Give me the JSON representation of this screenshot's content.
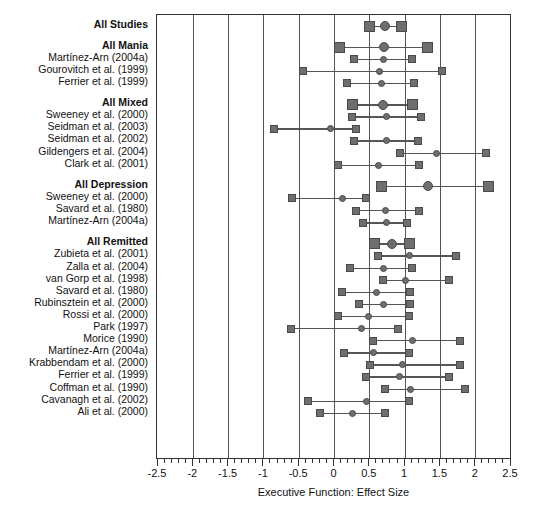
{
  "chart_data": {
    "type": "forest",
    "title": "",
    "xlabel": "Executive Function: Effect Size",
    "ylabel": "",
    "xlim": [
      -2.5,
      2.5
    ],
    "xticks": [
      -2.5,
      -2,
      -1.5,
      -1,
      -0.5,
      0,
      0.5,
      1,
      1.5,
      2,
      2.5
    ],
    "xtick_labels": [
      "-2.5",
      "-2",
      "-1.5",
      "-1",
      "-0.5",
      "0",
      "0.5",
      "1",
      "1.5",
      "2",
      "2.5"
    ],
    "minor_tick_step": 0.1,
    "grid": "vertical gridlines at every major tick",
    "legend": "none",
    "marker_point": "circle",
    "marker_ci_end": "square",
    "rows": [
      {
        "label": "All Studies",
        "group": true,
        "summary": true,
        "estimate": 0.72,
        "ci_low": 0.5,
        "ci_high": 0.95
      },
      {
        "label": "",
        "spacer": true
      },
      {
        "label": "All Mania",
        "group": true,
        "summary": true,
        "estimate": 0.7,
        "ci_low": 0.07,
        "ci_high": 1.32
      },
      {
        "label": "Martínez-Arn (2004a)",
        "group": false,
        "estimate": 0.69,
        "ci_low": 0.28,
        "ci_high": 1.1
      },
      {
        "label": "Gourovitch et al. (1999)",
        "group": false,
        "estimate": 0.64,
        "ci_low": -0.45,
        "ci_high": 1.52
      },
      {
        "label": "Ferrier et al. (1999)",
        "group": false,
        "estimate": 0.66,
        "ci_low": 0.17,
        "ci_high": 1.13
      },
      {
        "label": "",
        "spacer": true
      },
      {
        "label": "All Mixed",
        "group": true,
        "summary": true,
        "estimate": 0.68,
        "ci_low": 0.25,
        "ci_high": 1.11
      },
      {
        "label": "Sweeney et al. (2000)",
        "group": false,
        "estimate": 0.73,
        "ci_low": 0.25,
        "ci_high": 1.22
      },
      {
        "label": "Seidman et al. (2003)",
        "group": false,
        "estimate": -0.05,
        "ci_low": -0.85,
        "ci_high": 0.3
      },
      {
        "label": "Seidman et al. (2002)",
        "group": false,
        "estimate": 0.73,
        "ci_low": 0.28,
        "ci_high": 1.18
      },
      {
        "label": "Gildengers et al. (2004)",
        "group": false,
        "estimate": 1.45,
        "ci_low": 0.93,
        "ci_high": 2.15
      },
      {
        "label": "Clark et al. (2001)",
        "group": false,
        "estimate": 0.63,
        "ci_low": 0.05,
        "ci_high": 1.2
      },
      {
        "label": "",
        "spacer": true
      },
      {
        "label": "All Depression",
        "group": true,
        "summary": true,
        "estimate": 1.32,
        "ci_low": 0.66,
        "ci_high": 2.18
      },
      {
        "label": "Sweeney et al. (2000)",
        "group": false,
        "estimate": 0.12,
        "ci_low": -0.6,
        "ci_high": 0.45
      },
      {
        "label": "Savard et al. (1980)",
        "group": false,
        "estimate": 0.72,
        "ci_low": 0.3,
        "ci_high": 1.2
      },
      {
        "label": "Martínez-Arn (2004a)",
        "group": false,
        "estimate": 0.74,
        "ci_low": 0.4,
        "ci_high": 1.03
      },
      {
        "label": "",
        "spacer": true
      },
      {
        "label": "All Remitted",
        "group": true,
        "summary": true,
        "estimate": 0.82,
        "ci_low": 0.56,
        "ci_high": 1.06
      },
      {
        "label": "Zubieta et al. (2001)",
        "group": false,
        "estimate": 1.06,
        "ci_low": 0.62,
        "ci_high": 1.72
      },
      {
        "label": "Zalla et al. (2004)",
        "group": false,
        "estimate": 0.7,
        "ci_low": 0.22,
        "ci_high": 1.1
      },
      {
        "label": "van Gorp et al. (1998)",
        "group": false,
        "estimate": 1.0,
        "ci_low": 0.68,
        "ci_high": 1.62
      },
      {
        "label": "Savard et al. (1980)",
        "group": false,
        "estimate": 0.6,
        "ci_low": 0.1,
        "ci_high": 1.07
      },
      {
        "label": "Rubinsztein et al. (2000)",
        "group": false,
        "estimate": 0.7,
        "ci_low": 0.35,
        "ci_high": 1.07
      },
      {
        "label": "Rossi et al. (2000)",
        "group": false,
        "estimate": 0.48,
        "ci_low": 0.05,
        "ci_high": 1.05
      },
      {
        "label": "Park (1997)",
        "group": false,
        "estimate": 0.38,
        "ci_low": -0.62,
        "ci_high": 0.9
      },
      {
        "label": "Morice (1990)",
        "group": false,
        "estimate": 1.1,
        "ci_low": 0.55,
        "ci_high": 1.78
      },
      {
        "label": "Martínez-Arn (2004a)",
        "group": false,
        "estimate": 0.55,
        "ci_low": 0.14,
        "ci_high": 1.05
      },
      {
        "label": "Krabbendam et al. (2000)",
        "group": false,
        "estimate": 0.96,
        "ci_low": 0.5,
        "ci_high": 1.78
      },
      {
        "label": "Ferrier et al. (1999)",
        "group": false,
        "estimate": 0.92,
        "ci_low": 0.44,
        "ci_high": 1.62
      },
      {
        "label": "Coffman et al. (1990)",
        "group": false,
        "estimate": 1.08,
        "ci_low": 0.72,
        "ci_high": 1.85
      },
      {
        "label": "Cavanagh et al. (2002)",
        "group": false,
        "estimate": 0.46,
        "ci_low": -0.38,
        "ci_high": 1.05
      },
      {
        "label": "Ali et al. (2000)",
        "group": false,
        "estimate": 0.25,
        "ci_low": -0.2,
        "ci_high": 0.72
      }
    ]
  }
}
